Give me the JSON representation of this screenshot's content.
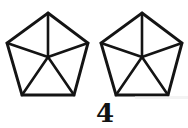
{
  "figure": {
    "caption": "4",
    "background_color": "#ffffff",
    "stroke_color": "#141414",
    "shape_count": 2,
    "shape_name": "pentagon"
  },
  "shapes": [
    {
      "id": "pentagon-left",
      "name": "pentagon-left",
      "center": {
        "x": 48,
        "y": 57
      },
      "vertices": [
        {
          "label": "apex",
          "x": 48,
          "y": 13
        },
        {
          "label": "upper-right",
          "x": 88,
          "y": 43
        },
        {
          "label": "lower-right",
          "x": 74,
          "y": 95
        },
        {
          "label": "lower-left",
          "x": 22,
          "y": 95
        },
        {
          "label": "upper-left",
          "x": 7,
          "y": 43
        }
      ]
    },
    {
      "id": "pentagon-right",
      "name": "pentagon-right",
      "center": {
        "x": 142,
        "y": 57
      },
      "vertices": [
        {
          "label": "apex",
          "x": 142,
          "y": 13
        },
        {
          "label": "upper-right",
          "x": 182,
          "y": 43
        },
        {
          "label": "lower-right",
          "x": 168,
          "y": 95
        },
        {
          "label": "lower-left",
          "x": 116,
          "y": 95
        },
        {
          "label": "upper-left",
          "x": 101,
          "y": 43
        }
      ]
    }
  ]
}
